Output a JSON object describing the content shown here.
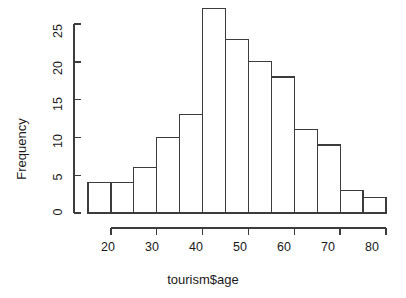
{
  "chart_data": {
    "type": "bar",
    "subtype": "histogram",
    "title": "",
    "xlabel": "tourism$age",
    "ylabel": "Frequency",
    "bin_width": 5,
    "bin_edges": [
      15,
      20,
      25,
      30,
      35,
      40,
      45,
      50,
      55,
      60,
      65,
      70,
      75,
      80
    ],
    "categories": [
      "15-20",
      "20-25",
      "25-30",
      "30-35",
      "35-40",
      "40-45",
      "45-50",
      "50-55",
      "55-60",
      "60-65",
      "65-70",
      "70-75",
      "75-80"
    ],
    "values": [
      4,
      4,
      6,
      10,
      13,
      27,
      23,
      20,
      18,
      11,
      9,
      3,
      2
    ],
    "x_tick_labels": [
      "20",
      "30",
      "40",
      "50",
      "60",
      "70",
      "80"
    ],
    "x_tick_values": [
      20,
      30,
      40,
      50,
      60,
      70,
      80
    ],
    "y_tick_labels": [
      "0",
      "5",
      "10",
      "15",
      "20",
      "25"
    ],
    "y_tick_values": [
      0,
      5,
      10,
      15,
      20,
      25
    ],
    "xlim": [
      15,
      80
    ],
    "ylim": [
      0,
      27
    ],
    "grid": false,
    "legend": false,
    "bar_fill_color": "#ffffff",
    "bar_stroke_color": "#3c3c3c",
    "background_color": "#ffffff",
    "text_color": "#1a1a1a"
  }
}
